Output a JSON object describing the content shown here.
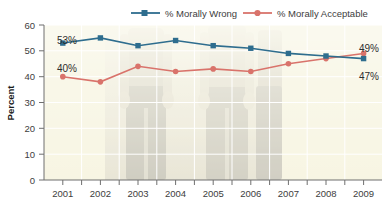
{
  "chart_data": {
    "type": "line",
    "title": "",
    "subtitle": "",
    "xlabel": "",
    "ylabel": "Percent",
    "categories": [
      "2001",
      "2002",
      "2003",
      "2004",
      "2005",
      "2006",
      "2007",
      "2008",
      "2009"
    ],
    "ylim": [
      0,
      60
    ],
    "ytick_step": 10,
    "yticks": [
      0,
      10,
      20,
      30,
      40,
      50,
      60
    ],
    "grid": true,
    "grid_color": "#ffffff",
    "legend_position": "top-right",
    "series": [
      {
        "name": "% Morally Wrong",
        "color": "#2e6d8e",
        "marker": "square",
        "values": [
          53,
          55,
          52,
          54,
          52,
          51,
          49,
          48,
          47
        ]
      },
      {
        "name": "% Morally Acceptable",
        "color": "#d9736b",
        "marker": "circle",
        "values": [
          40,
          38,
          44,
          42,
          43,
          42,
          45,
          47,
          49
        ]
      }
    ],
    "annotations": [
      {
        "text": "53%",
        "series": "% Morally Wrong",
        "category": "2001",
        "anchor": "above-left"
      },
      {
        "text": "40%",
        "series": "% Morally Acceptable",
        "category": "2001",
        "anchor": "above-left"
      },
      {
        "text": "49%",
        "series": "% Morally Acceptable",
        "category": "2009",
        "anchor": "above-right"
      },
      {
        "text": "47%",
        "series": "% Morally Wrong",
        "category": "2009",
        "anchor": "below-right"
      }
    ],
    "plot_background": "#f7f4dd",
    "axis_color": "#6f6f6f"
  },
  "legend": {
    "items": [
      {
        "label": "% Morally Wrong",
        "color": "#2e6d8e",
        "marker": "square"
      },
      {
        "label": "% Morally Acceptable",
        "color": "#d9736b",
        "marker": "circle"
      }
    ]
  },
  "yaxis": {
    "title": "Percent",
    "ticks": [
      "60",
      "50",
      "40",
      "30",
      "20",
      "10",
      "0"
    ]
  },
  "xaxis": {
    "ticks": [
      "2001",
      "2002",
      "2003",
      "2004",
      "2005",
      "2006",
      "2007",
      "2008",
      "2009"
    ]
  },
  "labels": {
    "blue_start": "53%",
    "red_start": "40%",
    "red_end": "49%",
    "blue_end": "47%"
  }
}
